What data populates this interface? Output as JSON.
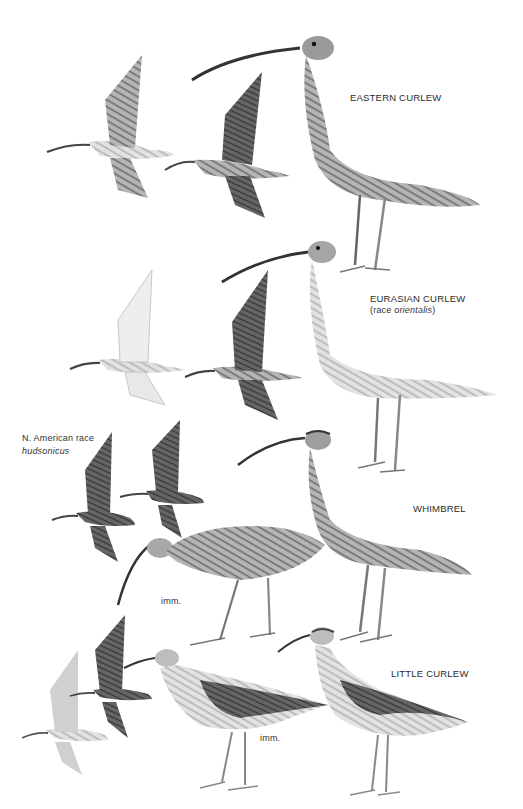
{
  "plate": {
    "species": [
      {
        "name": "EASTERN CURLEW"
      },
      {
        "name": "EURASIAN CURLEW",
        "note_prefix": "(race ",
        "note_race": "orientalis",
        "note_suffix": ")"
      },
      {
        "name": "WHIMBREL",
        "race_label": "N. American race",
        "race_name": "hudsonicus",
        "age_label": "imm."
      },
      {
        "name": "LITTLE CURLEW",
        "age_label": "imm."
      }
    ]
  },
  "colors": {
    "background": "#ffffff",
    "ink": "#2a2a2a",
    "bird_dark": "#4a4a4a",
    "bird_mid": "#8a8a8a",
    "bird_light": "#d8d8d8"
  }
}
